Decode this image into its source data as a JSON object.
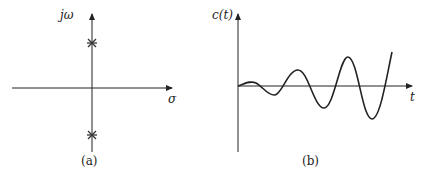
{
  "panel_a": {
    "y_axis_label": "jω",
    "x_axis_label": "σ",
    "caption": "(a)",
    "poles": [
      {
        "marker": "cross",
        "position": "upper imaginary axis"
      },
      {
        "marker": "cross",
        "position": "lower imaginary axis"
      }
    ]
  },
  "panel_b": {
    "y_axis_label": "c(t)",
    "x_axis_label": "t",
    "caption": "(b)",
    "curve": "growing oscillation"
  },
  "colors": {
    "ink": "#222222",
    "background": "#ffffff"
  }
}
